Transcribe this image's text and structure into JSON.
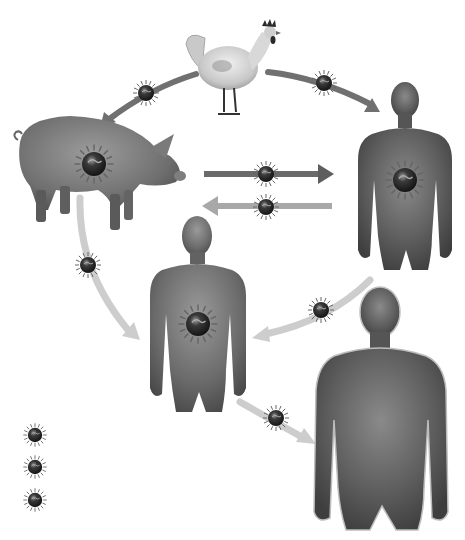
{
  "diagram": {
    "title": "Virus transmission cycle between chicken, pig and humans",
    "colors": {
      "background": "#ffffff",
      "arrow_dark": "#6e6e6e",
      "arrow_light": "#c8c8c8",
      "body_dark": "#4a4a4a",
      "body_mid": "#6b6b6b",
      "virus_core": "#2a2a2a",
      "virus_spike": "#555555"
    },
    "nodes": [
      {
        "id": "chicken",
        "label": "Chicken",
        "type": "chicken-icon"
      },
      {
        "id": "pig",
        "label": "Pig",
        "type": "pig-icon",
        "infected": true
      },
      {
        "id": "human-1",
        "label": "Human (top right)",
        "type": "human-icon",
        "infected": true
      },
      {
        "id": "human-2",
        "label": "Human (center)",
        "type": "human-icon",
        "infected": true
      },
      {
        "id": "human-3",
        "label": "Human (bottom right)",
        "type": "human-icon",
        "infected": false
      }
    ],
    "edges": [
      {
        "from": "chicken",
        "to": "pig",
        "style": "dark",
        "virus": true
      },
      {
        "from": "chicken",
        "to": "human-1",
        "style": "dark",
        "virus": true
      },
      {
        "from": "pig",
        "to": "human-1",
        "style": "dark",
        "virus": true
      },
      {
        "from": "human-1",
        "to": "pig",
        "style": "light",
        "virus": true
      },
      {
        "from": "pig",
        "to": "human-2",
        "style": "light",
        "virus": true
      },
      {
        "from": "human-1",
        "to": "human-2",
        "style": "light",
        "virus": true
      },
      {
        "from": "human-2",
        "to": "human-3",
        "style": "light",
        "virus": true
      }
    ],
    "legend": {
      "items": [
        {
          "icon": "virus-icon",
          "label": ""
        },
        {
          "icon": "virus-icon",
          "label": ""
        },
        {
          "icon": "virus-icon",
          "label": ""
        }
      ]
    }
  }
}
